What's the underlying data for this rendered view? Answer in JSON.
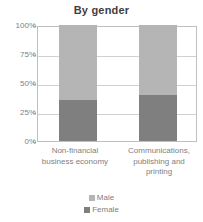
{
  "chart_data": {
    "type": "bar",
    "title": "By gender",
    "subtitle": "",
    "xlabel": "",
    "ylabel": "",
    "stacked": true,
    "stack_normalized": true,
    "orientation": "vertical",
    "grid": true,
    "legend_position": "bottom",
    "ylim": [
      0,
      100
    ],
    "ytick_labels": [
      "100%",
      "75%",
      "50%",
      "25%",
      "0%"
    ],
    "ytick_values": [
      100,
      75,
      50,
      25,
      0
    ],
    "categories": [
      "Non-financial business economy",
      "Communications, publishing and printing"
    ],
    "category_label_lines": [
      [
        "Non-financial",
        "business economy"
      ],
      [
        "Communications,",
        "publishing and",
        "printing"
      ]
    ],
    "series": [
      {
        "name": "Male",
        "color": "#b5b5b5",
        "values": [
          65,
          60
        ]
      },
      {
        "name": "Female",
        "color": "#7f7f7f",
        "values": [
          35,
          40
        ]
      }
    ]
  },
  "legend": {
    "items": [
      {
        "label": "Male",
        "color": "#b5b5b5"
      },
      {
        "label": "Female",
        "color": "#7f7f7f"
      }
    ]
  },
  "colors": {
    "male": "#b5b5b5",
    "female": "#7f7f7f",
    "plot_border": "#bfbfbf",
    "gridline": "#d0d0d0",
    "tick_text": "#808080",
    "title_text": "#3f3f3f",
    "background": "#ffffff"
  }
}
